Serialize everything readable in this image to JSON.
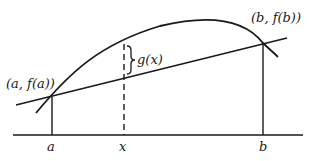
{
  "figure": {
    "colors": {
      "ink": "#1a1a1a",
      "background": "#ffffff"
    },
    "labels": {
      "point_a": "(a, f(a))",
      "point_b": "(b, f(b))",
      "gap": "g(x)",
      "axis_a": "a",
      "axis_x": "x",
      "axis_b": "b"
    },
    "elements": {
      "curve": "f(x)",
      "secant_line": "chord from (a,f(a)) to (b,f(b))",
      "dashed_line": "vertical at x",
      "brace": "marks g(x) between curve and chord"
    }
  }
}
